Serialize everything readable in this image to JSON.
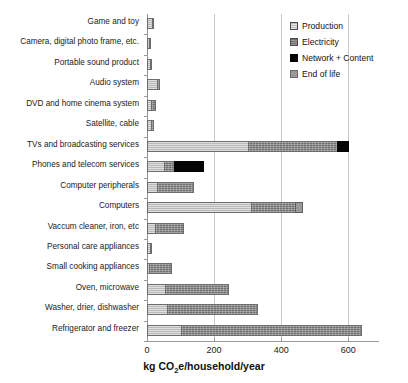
{
  "chart_data": {
    "type": "bar",
    "orientation": "horizontal",
    "stacked": true,
    "title": "",
    "xlabel": "kg CO2e/household/year",
    "xlabel_parts": {
      "pre": "kg CO",
      "sub": "2",
      "post": "e/household/year"
    },
    "ylabel": "",
    "xlim": [
      0,
      680
    ],
    "xticks": [
      0,
      200,
      400,
      600
    ],
    "xticklabels": [
      "0",
      "200",
      "400",
      "600"
    ],
    "grid": true,
    "grid_axis": "x",
    "legend_position": "upper right",
    "categories": [
      "Game and toy",
      "Camera, digital photo frame, etc.",
      "Portable sound product",
      "Audio system",
      "DVD and home cinema system",
      "Satellite, cable",
      "TVs and broadcasting services",
      "Phones and telecom services",
      "Computer peripherals",
      "Computers",
      "Vaccum cleaner, iron, etc",
      "Personal care appliances",
      "Small cooking appliances",
      "Oven, microwave",
      "Washer, drier, dishwasher",
      "Refrigerator and freezer"
    ],
    "series": [
      {
        "name": "Production",
        "color": "#b9b9b9",
        "values": [
          14,
          4,
          8,
          30,
          12,
          11,
          300,
          50,
          30,
          310,
          25,
          10,
          6,
          55,
          60,
          100
        ]
      },
      {
        "name": "Electricity",
        "color": "#6f6f6f",
        "values": [
          6,
          2,
          4,
          8,
          14,
          10,
          265,
          30,
          110,
          130,
          85,
          3,
          70,
          190,
          270,
          540
        ]
      },
      {
        "name": "Network + Content",
        "color": "#050505",
        "values": [
          0,
          0,
          0,
          0,
          0,
          0,
          36,
          90,
          0,
          0,
          0,
          0,
          0,
          0,
          0,
          0
        ]
      },
      {
        "name": "End of life",
        "color": "#9a9a9a",
        "values": [
          0,
          0,
          0,
          0,
          0,
          0,
          0,
          0,
          0,
          25,
          0,
          0,
          0,
          0,
          0,
          0
        ]
      }
    ],
    "totals": [
      20,
      6,
      12,
      38,
      26,
      21,
      601,
      170,
      140,
      465,
      110,
      13,
      76,
      245,
      330,
      640
    ]
  },
  "legend": {
    "items": [
      {
        "label": "Production",
        "swatch": "production"
      },
      {
        "label": "Electricity",
        "swatch": "electricity"
      },
      {
        "label": "Network + Content",
        "swatch": "network"
      },
      {
        "label": "End of life",
        "swatch": "endoflife"
      }
    ]
  }
}
